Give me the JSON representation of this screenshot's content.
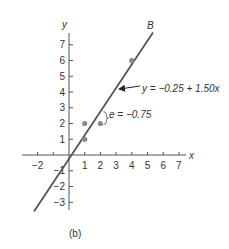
{
  "chart_data": {
    "type": "scatter",
    "title": "",
    "caption": "(b)",
    "xlabel": "x",
    "ylabel": "y",
    "xlim": [
      -2.5,
      7.5
    ],
    "ylim": [
      -3.5,
      7.5
    ],
    "x_ticks": [
      -2,
      -1,
      1,
      2,
      3,
      4,
      5,
      6,
      7
    ],
    "x_tick_labels": [
      "−2",
      "1",
      "2",
      "3",
      "4",
      "5",
      "6",
      "7"
    ],
    "y_ticks": [
      -3,
      -2,
      -1,
      1,
      2,
      3,
      4,
      5,
      6,
      7
    ],
    "y_tick_labels": [
      "−3",
      "−2",
      "−1",
      "1",
      "2",
      "3",
      "4",
      "5",
      "6",
      "7"
    ],
    "grid": false,
    "points": [
      {
        "x": 1,
        "y": 1
      },
      {
        "x": 1,
        "y": 2
      },
      {
        "x": 2,
        "y": 2
      },
      {
        "x": 4,
        "y": 6
      }
    ],
    "fit_line": {
      "name": "B",
      "intercept": -0.25,
      "slope": 1.5,
      "equation_label": "y = −0.25 + 1.50x",
      "x_range": [
        -2.23,
        5.35
      ]
    },
    "annotations": [
      {
        "type": "residual",
        "at_x": 2,
        "observed": 2,
        "predicted": 2.75,
        "label": "e = −0.75"
      },
      {
        "type": "arrow-label",
        "text": "y = −0.25 + 1.50x",
        "points_to_x": 3.0
      }
    ],
    "colors": {
      "axis": "#555555",
      "line": "#555555",
      "point": "#8a8a8a",
      "text": "#333333"
    }
  },
  "labels": {
    "x_axis": "x",
    "y_axis": "y",
    "line_name": "B",
    "equation": "y = −0.25 + 1.50x",
    "residual": "e = −0.75",
    "caption": "(b)"
  }
}
